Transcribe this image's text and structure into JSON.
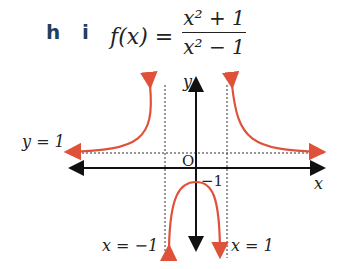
{
  "question": {
    "part_label": "h",
    "subpart_label": "i",
    "function_lhs": "f(x) =",
    "numerator": "x² + 1",
    "denominator": "x² − 1"
  },
  "graph": {
    "y_axis_label": "y",
    "x_axis_label": "x",
    "origin_label": "O",
    "y_intercept_label": "−1",
    "horizontal_asymptote_label": "y = 1",
    "left_vertical_asymptote_label": "x = −1",
    "right_vertical_asymptote_label": "x = 1",
    "curve_color": "#e0513a",
    "axis_color": "#111111"
  }
}
